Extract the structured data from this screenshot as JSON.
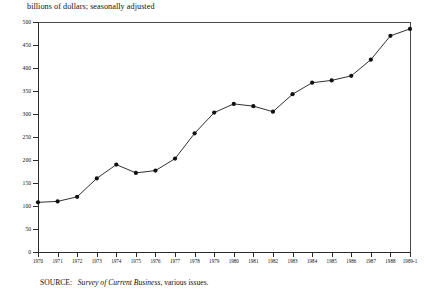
{
  "caption": {
    "top": "billions of dollars; seasonally adjusted"
  },
  "source": {
    "label": "SOURCE:",
    "italic_title": "Survey of Current Business",
    "trailing": ", various issues."
  },
  "colors": {
    "line": "#1a1a1a",
    "marker": "#111111",
    "axis": "#2b2b2b",
    "frame": "#4a4a4a",
    "background": "#ffffff"
  },
  "chart_data": {
    "type": "line",
    "title": "",
    "subtitle": "",
    "xlabel": "",
    "ylabel": "billions of dollars; seasonally adjusted",
    "ylim": [
      0,
      500
    ],
    "yticks": [
      0,
      50,
      100,
      150,
      200,
      250,
      300,
      350,
      400,
      450,
      500
    ],
    "ytick_labels": [
      "0",
      "50",
      "100",
      "150",
      "200",
      "250",
      "300",
      "350",
      "400",
      "450",
      "500"
    ],
    "grid": false,
    "legend": null,
    "marker": "filled-circle",
    "categories": [
      "1970",
      "1971",
      "1972",
      "1973",
      "1974",
      "1975",
      "1976",
      "1977",
      "1978",
      "1979",
      "1980",
      "1981",
      "1982",
      "1983",
      "1984",
      "1985",
      "1986",
      "1987",
      "1988",
      "1989-1"
    ],
    "values": [
      108,
      110,
      120,
      160,
      190,
      172,
      177,
      203,
      258,
      303,
      322,
      317,
      305,
      343,
      368,
      373,
      383,
      418,
      470,
      485
    ]
  }
}
